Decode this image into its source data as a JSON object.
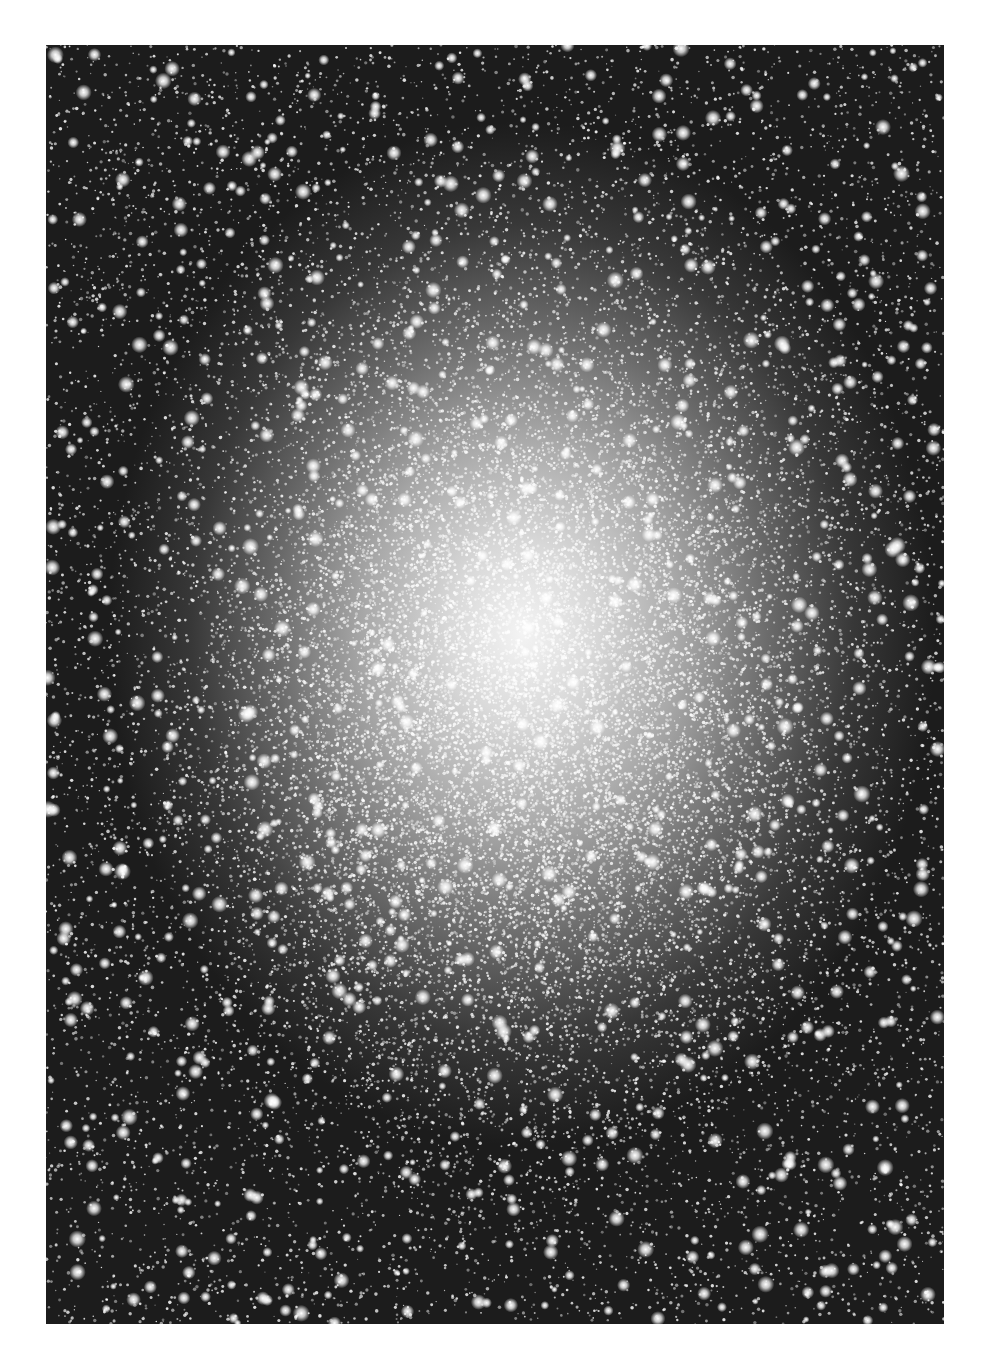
{
  "image": {
    "subject": "globular star cluster, dense star field",
    "frame": {
      "x": 46,
      "y": 45,
      "width": 898,
      "height": 1279
    },
    "background_color": "#ffffff",
    "core_center": {
      "x": 520,
      "y": 700
    },
    "colors": {
      "core": "#f4f4f4",
      "mid": "#8a8a8a",
      "edge": "#1c1c1c",
      "star": "#ffffff"
    },
    "star_count": 26000,
    "bright_star_count": 900
  }
}
